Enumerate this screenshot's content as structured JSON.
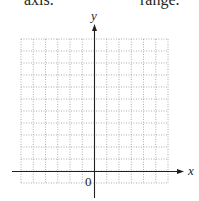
{
  "top_text": {
    "left": "axis.",
    "right": "range."
  },
  "graph": {
    "x_axis_label": "x",
    "y_axis_label": "y",
    "origin_label": "0",
    "grid": {
      "columns": 12,
      "rows": 12,
      "columns_left_of_y_axis": 6,
      "rows_above_x_axis": 11,
      "line_style": "dotted",
      "line_color": "#9a9a9a"
    },
    "axis_color": "#231f20"
  }
}
